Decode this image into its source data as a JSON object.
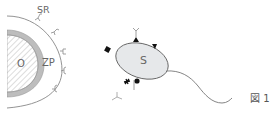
{
  "figure": {
    "caption": "図 1",
    "labels": {
      "sperm_receptor": "SR",
      "oocyte": "O",
      "zona_pellucida": "ZP",
      "sperm": "S"
    },
    "colors": {
      "line": "#777777",
      "zona_fill": "#bdbdbd",
      "sperm_fill": "#e6e8ea",
      "hatch": "#aaaaaa",
      "marker": "#111111"
    },
    "icons": [
      "receptor-y-icon",
      "triangle-marker-icon",
      "square-marker-icon",
      "star-marker-icon",
      "circle-marker-icon"
    ]
  }
}
